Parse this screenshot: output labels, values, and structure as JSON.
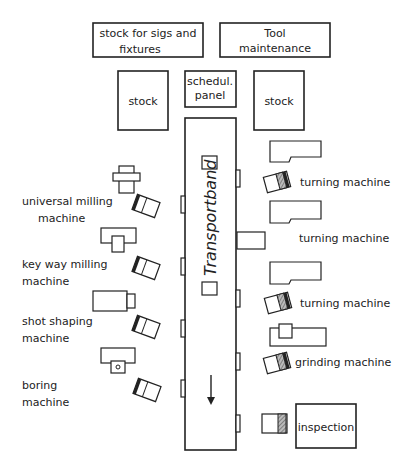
{
  "diagram": {
    "type": "shop-floor-layout",
    "top_boxes": [
      {
        "id": "jigs-stock",
        "lines": [
          "stock for sigs and",
          "fixtures"
        ]
      },
      {
        "id": "tool-maintenance",
        "lines": [
          "Tool",
          "maintenance"
        ]
      }
    ],
    "upper_boxes": [
      {
        "id": "stock-left",
        "label": "stock"
      },
      {
        "id": "schedul-panel",
        "lines": [
          "schedul.",
          "panel"
        ]
      },
      {
        "id": "stock-right",
        "label": "stock"
      }
    ],
    "conveyor": {
      "label": "Transportband",
      "direction": "down",
      "arrow_glyph": "↓"
    },
    "left_machines": [
      {
        "id": "universal-milling",
        "lines": [
          "universal milling",
          "machine"
        ]
      },
      {
        "id": "key-way-milling",
        "lines": [
          "key way milling",
          "machine"
        ]
      },
      {
        "id": "shot-shaping",
        "lines": [
          "shot shaping",
          "machine"
        ]
      },
      {
        "id": "boring",
        "lines": [
          "boring",
          "machine"
        ]
      }
    ],
    "right_machines": [
      {
        "id": "turning-1",
        "label": "turning machine"
      },
      {
        "id": "turning-2",
        "label": "turning machine"
      },
      {
        "id": "turning-3",
        "label": "turning machine"
      },
      {
        "id": "grinding",
        "label": "grinding machine"
      }
    ],
    "inspection": {
      "label": "inspection"
    }
  }
}
